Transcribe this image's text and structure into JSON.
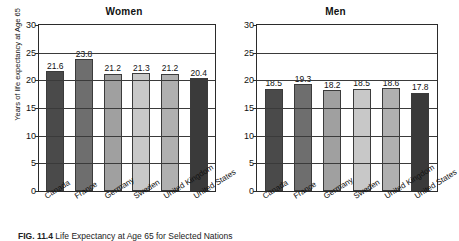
{
  "figure": {
    "caption_number": "FIG. 11.4",
    "caption_text": "Life Expectancy at Age 65 for Selected Nations"
  },
  "chart_data": {
    "type": "bar",
    "title": "Life Expectancy at Age 65 for Selected Nations",
    "xlabel": "",
    "ylabel": "Years of life expectancy at Age 65",
    "ylim": [
      0,
      30
    ],
    "yticks": [
      0,
      5,
      10,
      15,
      20,
      25,
      30
    ],
    "grid": true,
    "legend": "none",
    "categories": [
      "Canada",
      "France",
      "Germany",
      "Sweden",
      "United Kingdom",
      "United States"
    ],
    "panels": [
      {
        "title": "Women",
        "values": [
          21.6,
          23.8,
          21.2,
          21.3,
          21.2,
          20.4
        ],
        "labels": [
          "21.6",
          "23.8",
          "21.2",
          "21.3",
          "21.2",
          "20.4"
        ]
      },
      {
        "title": "Men",
        "values": [
          18.5,
          19.3,
          18.2,
          18.5,
          18.6,
          17.8
        ],
        "labels": [
          "18.5",
          "19.3",
          "18.2",
          "18.5",
          "18.6",
          "17.8"
        ]
      }
    ],
    "bar_colors": [
      "#4a4a4a",
      "#6e6e6e",
      "#a0a0a0",
      "#c8c8c8",
      "#b0b0b0",
      "#3a3a3a"
    ],
    "ytick_labels": [
      "0",
      "5",
      "10",
      "15",
      "20",
      "25",
      "30"
    ]
  }
}
